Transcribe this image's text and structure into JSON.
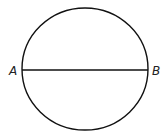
{
  "diagram": {
    "shape": "circle",
    "circle": {
      "cx": 85,
      "cy": 69,
      "rx": 63,
      "ry": 61,
      "stroke": "#111111"
    },
    "diameter": {
      "x1": 22,
      "y1": 70,
      "x2": 148,
      "y2": 70,
      "stroke": "#111111"
    },
    "labels": {
      "left": "A",
      "right": "B"
    }
  }
}
